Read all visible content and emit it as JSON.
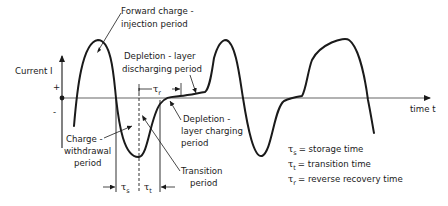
{
  "axes": {
    "y_label": "Current I",
    "x_label": "time t",
    "plus_sign": "+",
    "minus_sign": "-"
  },
  "annotations": {
    "forward_injection": [
      "Forward charge -",
      "injection period"
    ],
    "depletion_discharging": [
      "Depletion - layer",
      "discharging period"
    ],
    "depletion_charging": [
      "Depletion -",
      "layer charging",
      "period"
    ],
    "charge_withdrawal": [
      "Charge -",
      "withdrawal",
      "period"
    ],
    "transition": [
      "Transition",
      "period"
    ]
  },
  "intervals": {
    "tau_s": {
      "symbol": "τ",
      "sub": "s"
    },
    "tau_t": {
      "symbol": "τ",
      "sub": "t"
    },
    "tau_r": {
      "symbol": "τ",
      "sub": "r"
    }
  },
  "legend": [
    {
      "symbol": "τ",
      "sub": "s",
      "text": "= storage time"
    },
    {
      "symbol": "τ",
      "sub": "t",
      "text": "= transition time"
    },
    {
      "symbol": "τ",
      "sub": "r",
      "text": "= reverse recovery time"
    }
  ],
  "colors": {
    "ink": "#1a1a1a",
    "axis": "#555555",
    "background": "#ffffff"
  }
}
